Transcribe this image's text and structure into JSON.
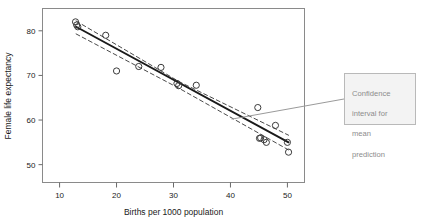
{
  "chart_data": {
    "type": "scatter",
    "title": "",
    "xlabel": "Births per 1000 population",
    "ylabel": "Female life expectancy",
    "xlim": [
      7,
      53
    ],
    "ylim": [
      46,
      85
    ],
    "xticks": [
      10,
      20,
      30,
      40,
      50
    ],
    "yticks": [
      50,
      60,
      70,
      80
    ],
    "grid": false,
    "legend": "none",
    "marker": "open-circle",
    "points": [
      {
        "x": 12.8,
        "y": 82.0
      },
      {
        "x": 13.0,
        "y": 81.3
      },
      {
        "x": 13.2,
        "y": 80.9
      },
      {
        "x": 18.1,
        "y": 79.0
      },
      {
        "x": 20.0,
        "y": 71.0
      },
      {
        "x": 23.9,
        "y": 72.0
      },
      {
        "x": 27.8,
        "y": 71.8
      },
      {
        "x": 30.6,
        "y": 68.2
      },
      {
        "x": 30.9,
        "y": 67.7
      },
      {
        "x": 34.0,
        "y": 67.8
      },
      {
        "x": 44.8,
        "y": 62.8
      },
      {
        "x": 45.1,
        "y": 55.9
      },
      {
        "x": 45.3,
        "y": 56.0
      },
      {
        "x": 45.9,
        "y": 55.6
      },
      {
        "x": 46.3,
        "y": 55.0
      },
      {
        "x": 47.9,
        "y": 58.8
      },
      {
        "x": 50.0,
        "y": 55.0
      },
      {
        "x": 50.2,
        "y": 52.8
      }
    ],
    "series": [
      {
        "name": "fitted regression line",
        "style": "solid",
        "x": [
          12.9,
          50.2
        ],
        "y": [
          80.9,
          55.0
        ]
      },
      {
        "name": "upper confidence limit for mean prediction",
        "style": "dashed",
        "x": [
          12.9,
          31.0,
          50.2
        ],
        "y": [
          82.2,
          68.6,
          56.6
        ]
      },
      {
        "name": "lower confidence limit for mean prediction",
        "style": "dashed",
        "x": [
          12.9,
          31.0,
          50.2
        ],
        "y": [
          79.3,
          67.1,
          53.3
        ]
      }
    ],
    "annotations": [
      {
        "name": "confidence-interval-callout",
        "text": "Confidence\ninterval for\nmean\nprediction",
        "points_to": {
          "x": 40.2,
          "y": 60.2
        }
      }
    ],
    "colors": {
      "marker_stroke": "#3a3a3a",
      "fit_line": "#1a1a1a",
      "ci_line": "#4a4a4a",
      "frame": "#8a8a8a",
      "callout_bg": "#f3f3f3",
      "callout_border": "#b9b9b9",
      "callout_text": "#8c8c8c",
      "leader_line": "#9a9a9a",
      "background": "#ffffff"
    }
  },
  "xtick_labels": [
    "10",
    "20",
    "30",
    "40",
    "50"
  ],
  "ytick_labels": [
    "50",
    "60",
    "70",
    "80"
  ],
  "callout": {
    "line1": "Confidence",
    "line2": "interval for",
    "line3": "mean",
    "line4": "prediction"
  }
}
